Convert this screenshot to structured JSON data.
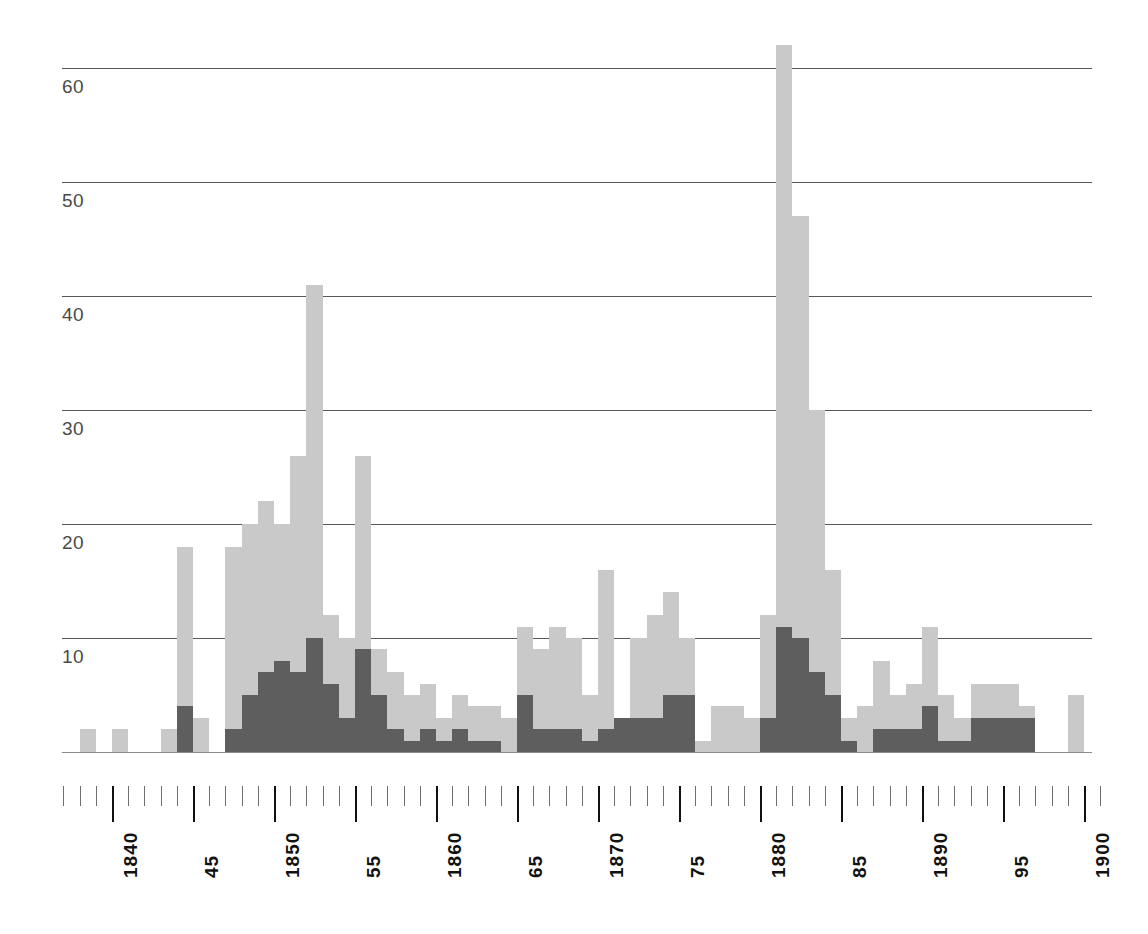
{
  "chart_data": {
    "type": "bar",
    "title": "",
    "subtitle": "",
    "xlabel": "",
    "ylabel": "",
    "stacked": true,
    "grid": true,
    "legend_position": "none",
    "xlim": [
      1837,
      1901
    ],
    "ylim": [
      0,
      63
    ],
    "y_ticks": [
      10,
      20,
      30,
      40,
      50,
      60
    ],
    "y_tick_labels": [
      "10",
      "20",
      "30",
      "40",
      "50",
      "60"
    ],
    "x_major_ticks": [
      1840,
      1845,
      1850,
      1855,
      1860,
      1865,
      1870,
      1875,
      1880,
      1885,
      1890,
      1895,
      1900
    ],
    "x_major_tick_labels": [
      "1840",
      "45",
      "1850",
      "55",
      "1860",
      "65",
      "1870",
      "75",
      "1880",
      "85",
      "1890",
      "95",
      "1900"
    ],
    "x_minor_tick_step": 1,
    "colors": {
      "series_light": "#c9c9c9",
      "series_dark": "#5e5e5e",
      "gridline": "#3a3a3a",
      "baseline": "#8c8c8c",
      "axis_text": "#111111",
      "y_label_text": "#4a4a4a",
      "background": "#ffffff"
    },
    "series": [
      {
        "name": "light",
        "color": "#c9c9c9"
      },
      {
        "name": "dark",
        "color": "#5e5e5e"
      }
    ],
    "x": [
      1838,
      1839,
      1840,
      1841,
      1842,
      1843,
      1844,
      1845,
      1846,
      1847,
      1848,
      1849,
      1850,
      1851,
      1852,
      1853,
      1854,
      1855,
      1856,
      1857,
      1858,
      1859,
      1860,
      1861,
      1862,
      1863,
      1864,
      1865,
      1866,
      1867,
      1868,
      1869,
      1870,
      1871,
      1872,
      1873,
      1874,
      1875,
      1876,
      1877,
      1878,
      1879,
      1880,
      1881,
      1882,
      1883,
      1884,
      1885,
      1886,
      1887,
      1888,
      1889,
      1890,
      1891,
      1892,
      1893,
      1894,
      1895,
      1896,
      1897,
      1898,
      1899
    ],
    "values_total": [
      2,
      0,
      2,
      0,
      0,
      2,
      18,
      3,
      0,
      18,
      20,
      22,
      20,
      26,
      41,
      12,
      10,
      26,
      9,
      7,
      5,
      6,
      3,
      5,
      4,
      4,
      3,
      11,
      9,
      11,
      10,
      5,
      16,
      3,
      10,
      12,
      14,
      10,
      1,
      4,
      4,
      3,
      12,
      62,
      47,
      30,
      16,
      3,
      4,
      8,
      5,
      6,
      11,
      5,
      3,
      6,
      6,
      6,
      4,
      0,
      0,
      5
    ],
    "values_dark": [
      0,
      0,
      0,
      0,
      0,
      0,
      4,
      0,
      0,
      2,
      5,
      7,
      8,
      7,
      10,
      6,
      3,
      9,
      5,
      2,
      1,
      2,
      1,
      2,
      1,
      1,
      0,
      5,
      2,
      2,
      2,
      1,
      2,
      3,
      3,
      3,
      5,
      5,
      0,
      0,
      0,
      0,
      3,
      11,
      10,
      7,
      5,
      1,
      0,
      2,
      2,
      2,
      4,
      1,
      1,
      3,
      3,
      3,
      3,
      0,
      0,
      0
    ]
  }
}
